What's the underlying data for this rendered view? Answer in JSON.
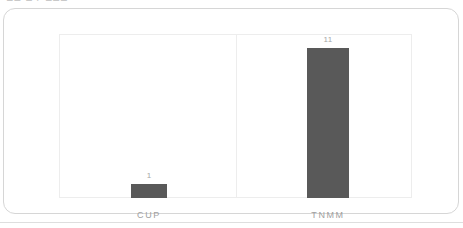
{
  "page": {
    "clipped_heading": "12   1   /   122"
  },
  "card": {
    "label": "chart-card"
  },
  "chart_data": {
    "type": "bar",
    "title": "",
    "subtitle": "",
    "xlabel": "",
    "ylabel": "",
    "categories": [
      "CUP",
      "TNMM"
    ],
    "values": [
      1,
      11
    ],
    "value_labels": [
      "1",
      "11"
    ],
    "series": [
      {
        "name": "Count",
        "values": [
          1,
          11
        ]
      }
    ],
    "ylim": [
      0,
      12
    ],
    "grid": false,
    "legend": false,
    "legend_position": "none",
    "bar_color": "#595959",
    "plot_border_color": "#ededed",
    "label_color": "#a0a0a0"
  }
}
